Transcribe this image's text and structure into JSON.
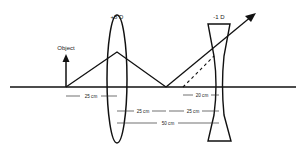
{
  "diagram": {
    "object_label": "Object",
    "convex_lens": {
      "power_label": "+8 D"
    },
    "concave_lens": {
      "power_label": "-1 D"
    },
    "measurements": {
      "object_to_convex": "25 cm",
      "image_to_concave": "20 cm",
      "convex_to_image": "25 cm",
      "image_to_concave_second": "25 cm",
      "lens_separation": "50 cm"
    }
  },
  "colors": {
    "line": "#111111",
    "background": "#ffffff"
  }
}
